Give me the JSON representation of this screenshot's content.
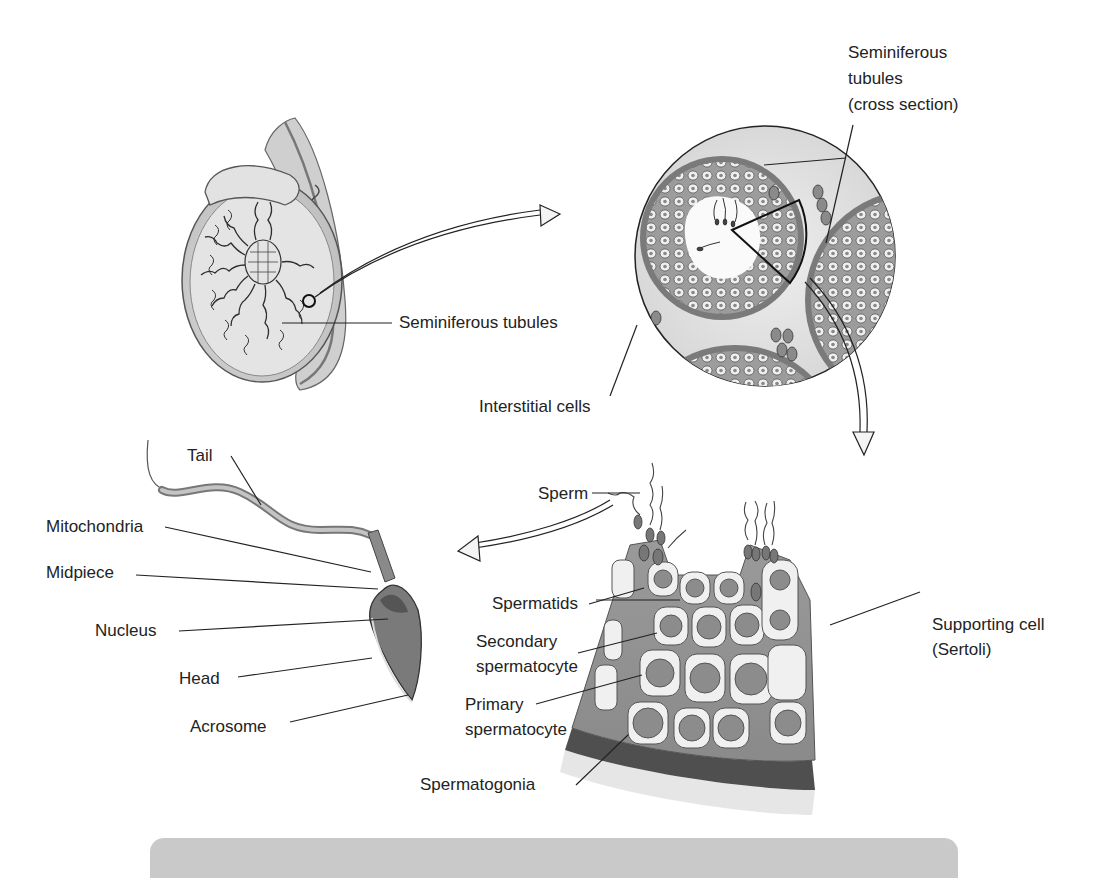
{
  "diagram": {
    "type": "anatomical illustration",
    "panels": [
      {
        "id": "testis",
        "name": "Testis (longitudinal section)"
      },
      {
        "id": "cross-section",
        "name": "Seminiferous tubules cross section"
      },
      {
        "id": "tubule-wall",
        "name": "Tubule wall wedge (spermatogenesis)"
      },
      {
        "id": "sperm",
        "name": "Mature sperm"
      }
    ],
    "labels": {
      "seminiferous_tubules": "Seminiferous tubules",
      "seminiferous_cross_1": "Seminiferous",
      "seminiferous_cross_2": "tubules",
      "seminiferous_cross_3": "(cross section)",
      "interstitial_cells": "Interstitial cells",
      "tail": "Tail",
      "mitochondria": "Mitochondria",
      "midpiece": "Midpiece",
      "nucleus": "Nucleus",
      "head": "Head",
      "acrosome": "Acrosome",
      "sperm": "Sperm",
      "spermatids": "Spermatids",
      "secondary_1": "Secondary",
      "secondary_2": "spermatocyte",
      "primary_1": "Primary",
      "primary_2": "spermatocyte",
      "spermatogonia": "Spermatogonia",
      "supporting_1": "Supporting cell",
      "supporting_2": "(Sertoli)"
    },
    "colors": {
      "background": "#ffffff",
      "text": "#232323",
      "tissue_dark": "#6e6e6e",
      "tissue_mid": "#a8a8a8",
      "tissue_light": "#dcdcdc",
      "caption_bar": "#c9c9c9"
    }
  }
}
